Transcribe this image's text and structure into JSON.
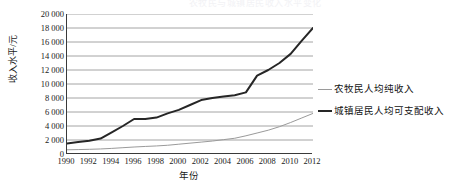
{
  "title_faint": "农牧民与城镇居民收入水平变化",
  "axes": {
    "y_title": "收入水平/元",
    "x_title": "年份"
  },
  "legend": [
    {
      "label": "农牧民人均纯收入",
      "color": "#9a9a9a",
      "style": "thin"
    },
    {
      "label": "城镇居民人均可支配收入",
      "color": "#262626",
      "style": "thick"
    }
  ],
  "chart_data": {
    "type": "line",
    "title": "",
    "xlabel": "年份",
    "ylabel": "收入水平/元",
    "xlim": [
      1990,
      2012
    ],
    "ylim": [
      0,
      20000
    ],
    "grid": true,
    "legend_position": "right",
    "ytick_labels": [
      "0",
      "2 000",
      "4 000",
      "6 000",
      "8 000",
      "10 000",
      "12 000",
      "14 000",
      "16 000",
      "18 000",
      "20 000"
    ],
    "ytick_values": [
      0,
      2000,
      4000,
      6000,
      8000,
      10000,
      12000,
      14000,
      16000,
      18000,
      20000
    ],
    "xtick_labels": [
      "1990",
      "1992",
      "1994",
      "1996",
      "1998",
      "2000",
      "2002",
      "2004",
      "2006",
      "2008",
      "2010",
      "2012"
    ],
    "xtick_values": [
      1990,
      1992,
      1994,
      1996,
      1998,
      2000,
      2002,
      2004,
      2006,
      2008,
      2010,
      2012
    ],
    "x": [
      1990,
      1991,
      1992,
      1993,
      1994,
      1995,
      1996,
      1997,
      1998,
      1999,
      2000,
      2001,
      2002,
      2003,
      2004,
      2005,
      2006,
      2007,
      2008,
      2009,
      2010,
      2011,
      2012
    ],
    "series": [
      {
        "name": "城镇居民人均可支配收入",
        "color": "#262626",
        "width": 2,
        "values": [
          1500,
          1700,
          1900,
          2200,
          3100,
          4000,
          5000,
          5000,
          5200,
          5800,
          6300,
          7000,
          7700,
          8000,
          8200,
          8400,
          8800,
          11200,
          12000,
          13000,
          14300,
          16200,
          18000
        ]
      },
      {
        "name": "农牧民人均纯收入",
        "color": "#9a9a9a",
        "width": 1,
        "values": [
          600,
          630,
          670,
          720,
          800,
          900,
          1000,
          1080,
          1150,
          1250,
          1400,
          1550,
          1700,
          1850,
          2050,
          2250,
          2600,
          3000,
          3400,
          3900,
          4500,
          5150,
          5800
        ]
      }
    ]
  }
}
